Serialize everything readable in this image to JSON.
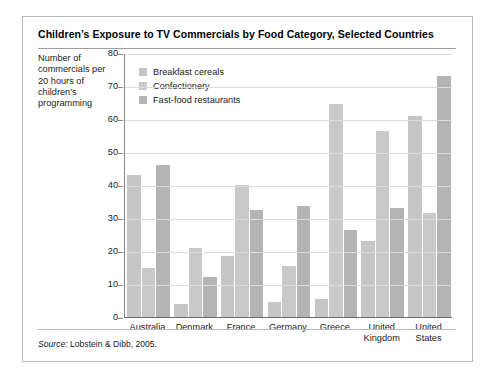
{
  "figure": {
    "title": "Children’s Exposure to TV Commercials by Food Category, Selected Countries",
    "source_prefix": "Source:",
    "source_text": "Lobstein & Dibb, 2005.",
    "frame_color": "#b9b9b9",
    "background": "#ffffff"
  },
  "chart_data": {
    "type": "bar",
    "title": "Children’s Exposure to TV Commercials by Food Category, Selected Countries",
    "subtitle": "",
    "xlabel": "",
    "ylabel": "Number of commercials per 20 hours of children’s programming",
    "ylim": [
      0,
      80
    ],
    "yticks": [
      0,
      10,
      20,
      30,
      40,
      50,
      60,
      70,
      80
    ],
    "ytick_labels": [
      "0",
      "10",
      "20",
      "30",
      "40",
      "50",
      "60",
      "70",
      "80"
    ],
    "grid": "horizontal",
    "legend_position": "top-left-inside",
    "categories": [
      "Australia",
      "Denmark",
      "France",
      "Germany",
      "Greece",
      "United Kingdom",
      "United States"
    ],
    "category_lines": [
      [
        "Australia"
      ],
      [
        "Denmark"
      ],
      [
        "France"
      ],
      [
        "Germany"
      ],
      [
        "Greece"
      ],
      [
        "United",
        "Kingdom"
      ],
      [
        "United",
        "States"
      ]
    ],
    "series": [
      {
        "name": "Breakfast cereals",
        "color": "#c6c6c6",
        "values": [
          43,
          4,
          18.5,
          4.5,
          5.5,
          23,
          61
        ]
      },
      {
        "name": "Confectionery",
        "color": "#c9c9c9",
        "values": [
          15,
          21,
          40,
          15.5,
          64.5,
          56.5,
          31.5
        ]
      },
      {
        "name": "Fast-food restaurants",
        "color": "#b4b4b4",
        "values": [
          46,
          12,
          32.5,
          33.5,
          26.5,
          33,
          73
        ]
      }
    ],
    "axis_color": "#8c8c8c",
    "grid_color": "#dcdcdc"
  }
}
